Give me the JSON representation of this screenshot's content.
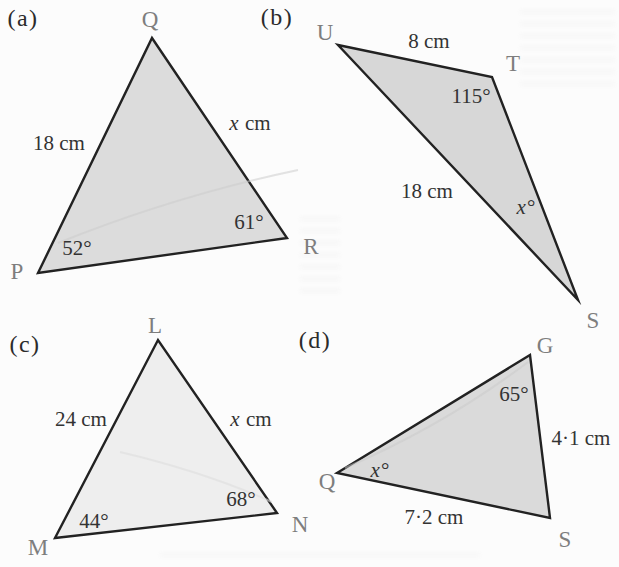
{
  "triangles": {
    "a": {
      "part_label": "(a)",
      "vertices": {
        "P": "P",
        "Q": "Q",
        "R": "R"
      },
      "side_PQ": "18 cm",
      "side_QR": {
        "variable": "x",
        "unit": "cm"
      },
      "angle_P": "52°",
      "angle_R": "61°",
      "fill": "#dcdcdc"
    },
    "b": {
      "part_label": "(b)",
      "vertices": {
        "U": "U",
        "T": "T",
        "S": "S"
      },
      "side_UT": "8 cm",
      "side_US": "18 cm",
      "angle_T": "115°",
      "angle_S": {
        "variable": "x",
        "unit": "°"
      },
      "fill": "#d7d7d7"
    },
    "c": {
      "part_label": "(c)",
      "vertices": {
        "L": "L",
        "M": "M",
        "N": "N"
      },
      "side_ML": "24 cm",
      "side_LN": {
        "variable": "x",
        "unit": "cm"
      },
      "angle_M": "44°",
      "angle_N": "68°",
      "fill": "#eeeeee"
    },
    "d": {
      "part_label": "(d)",
      "vertices": {
        "G": "G",
        "Q": "Q",
        "S": "S"
      },
      "side_GS": "4·1 cm",
      "side_QS": "7·2 cm",
      "angle_G": "65°",
      "angle_Q": {
        "variable": "x",
        "unit": "°"
      },
      "fill": "#dadada"
    }
  },
  "colors": {
    "triangle_stroke": "#222222",
    "vertex_label": "#7e7e7e",
    "measurement_text": "#333333",
    "part_label": "#2b2b2b",
    "background": "#fcfcfc"
  }
}
